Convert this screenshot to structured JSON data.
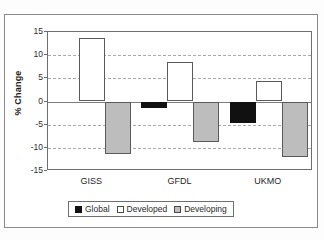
{
  "chart_data": {
    "type": "bar",
    "title": "",
    "subtitle": "",
    "xlabel": "",
    "ylabel": "% Change",
    "categories": [
      "GISS",
      "GFDL",
      "UKMO"
    ],
    "series": [
      {
        "name": "Global",
        "values": [
          0,
          -1.5,
          -4.6
        ],
        "color": "#111111"
      },
      {
        "name": "Developed",
        "values": [
          13.7,
          8.6,
          4.5
        ],
        "color": "#ffffff"
      },
      {
        "name": "Developing",
        "values": [
          -11.3,
          -8.8,
          -12.0
        ],
        "color": "#bdbdbd"
      }
    ],
    "ylim": [
      -15,
      15
    ],
    "yticks": [
      15,
      10,
      5,
      0,
      -5,
      -10,
      -15
    ],
    "ytick_labels": [
      "15",
      "10",
      "5",
      "0",
      "-5",
      "-10",
      "-15"
    ],
    "grid": true,
    "grid_style": "dashed-horizontal",
    "legend_position": "bottom",
    "legend_entries": [
      "Global",
      "Developed",
      "Developing"
    ],
    "frame": true
  },
  "colors": {
    "global": "#111111",
    "developed": "#ffffff",
    "developing": "#bdbdbd",
    "axis": "#6e6e6e",
    "grid": "#a9a9a9",
    "text": "#1f1f1f"
  }
}
